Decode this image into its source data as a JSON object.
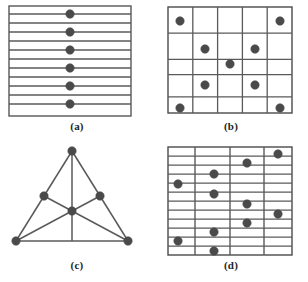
{
  "figure": {
    "background_color": "#ffffff",
    "line_color": "#5a5a5a",
    "border_color": "#4a4a4a",
    "dot_color": "#4a4a4a",
    "dot_radius": 4.2,
    "panels": [
      {
        "id": "a",
        "caption": "(a)",
        "type": "parallel-lines-with-collinear-points",
        "description": "Rectangular frame filled with 13 horizontal parallel lines; 6 points aligned on a single vertical axis at the centre, each lying on an alternate line.",
        "frame": {
          "x": 9,
          "y": 6,
          "width": 122,
          "height": 110
        },
        "line_count": 13,
        "point_count": 6,
        "points": [
          {
            "x": 70,
            "y": 14
          },
          {
            "x": 70,
            "y": 32
          },
          {
            "x": 70,
            "y": 50
          },
          {
            "x": 70,
            "y": 68
          },
          {
            "x": 70,
            "y": 86
          },
          {
            "x": 70,
            "y": 104
          }
        ]
      },
      {
        "id": "b",
        "caption": "(b)",
        "type": "grid-configuration",
        "description": "5 by 5 rectangular grid of horizontal and vertical lines with 9 points arranged in an X (diagonal cross) pattern.",
        "frame": {
          "x": 14,
          "y": 7,
          "width": 124,
          "height": 106
        },
        "rows": 5,
        "columns": 5,
        "point_count": 9,
        "points": [
          {
            "x": 26,
            "y": 21,
            "cell": "r1c1"
          },
          {
            "x": 126,
            "y": 21,
            "cell": "r1c5"
          },
          {
            "x": 51,
            "y": 49,
            "cell": "r2c2"
          },
          {
            "x": 101,
            "y": 49,
            "cell": "r2c4"
          },
          {
            "x": 76,
            "y": 64,
            "cell": "r3c3"
          },
          {
            "x": 51,
            "y": 85,
            "cell": "r4c2"
          },
          {
            "x": 101,
            "y": 85,
            "cell": "r4c4"
          },
          {
            "x": 26,
            "y": 108,
            "cell": "r5c1"
          },
          {
            "x": 126,
            "y": 108,
            "cell": "r5c5"
          }
        ]
      },
      {
        "id": "c",
        "caption": "(c)",
        "type": "fano-plane-configuration",
        "description": "Triangle with three vertices, three edge midpoints and one centre point; seven points joined by six straight segments forming the Fano-plane style configuration.",
        "point_count": 7,
        "segment_count": 6,
        "points": [
          {
            "name": "apex",
            "x": 72,
            "y": 10
          },
          {
            "name": "bottom-left",
            "x": 16,
            "y": 100
          },
          {
            "name": "bottom-right",
            "x": 128,
            "y": 100
          },
          {
            "name": "mid-left",
            "x": 44,
            "y": 55
          },
          {
            "name": "mid-right",
            "x": 100,
            "y": 55
          },
          {
            "name": "centre",
            "x": 72,
            "y": 70
          },
          {
            "name": "base-centre",
            "x": 72,
            "y": 100
          }
        ],
        "segments": [
          {
            "from": "apex",
            "to": "bottom-left"
          },
          {
            "from": "apex",
            "to": "bottom-right"
          },
          {
            "from": "bottom-left",
            "to": "bottom-right"
          },
          {
            "from": "apex",
            "to": "base-centre"
          },
          {
            "from": "bottom-left",
            "to": "mid-right"
          },
          {
            "from": "bottom-right",
            "to": "mid-left"
          }
        ]
      },
      {
        "id": "d",
        "caption": "(d)",
        "type": "mixed-grid-configuration",
        "description": "Rectangular frame crossed by 12 horizontal lines and 3 interior vertical lines; 10 points scattered on the intersections forming a descending/ascending zig-zag pattern.",
        "frame": {
          "x": 14,
          "y": 6,
          "width": 124,
          "height": 108
        },
        "horizontal_line_count": 12,
        "vertical_line_count": 3,
        "point_count": 10,
        "points": [
          {
            "x": 124,
            "y": 13
          },
          {
            "x": 93,
            "y": 22
          },
          {
            "x": 60,
            "y": 33
          },
          {
            "x": 24,
            "y": 43
          },
          {
            "x": 60,
            "y": 53
          },
          {
            "x": 93,
            "y": 63
          },
          {
            "x": 124,
            "y": 73
          },
          {
            "x": 93,
            "y": 82
          },
          {
            "x": 60,
            "y": 91
          },
          {
            "x": 24,
            "y": 100
          },
          {
            "x": 60,
            "y": 110
          }
        ]
      }
    ]
  }
}
